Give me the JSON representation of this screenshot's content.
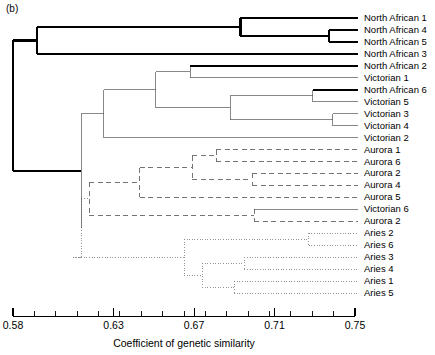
{
  "panel": {
    "label": "(b)"
  },
  "axis": {
    "title": "Coefficient of genetic similarity",
    "min": 0.58,
    "max": 0.75,
    "major_ticks": [
      0.58,
      0.63,
      0.67,
      0.71,
      0.75
    ],
    "major_tick_labels": [
      "0.58",
      "0.63",
      "0.67",
      "0.71",
      "0.75"
    ],
    "minor_tick_count": 16
  },
  "colors": {
    "line": "#000000",
    "line_thin": "#555555",
    "line_dashed": "#666666",
    "line_dotted": "#888888",
    "axis": "#000000",
    "text": "#000000",
    "background": "#ffffff"
  },
  "chart_data": {
    "type": "dendrogram",
    "title": "",
    "xlabel": "Coefficient of genetic similarity",
    "ylabel": "",
    "xlim": [
      0.58,
      0.75
    ],
    "grid": false,
    "legend": "none",
    "leaf_order": [
      "North African 1",
      "North African 4",
      "North African 5",
      "North African 3",
      "North African 2",
      "Victorian 1",
      "North African 6",
      "Victorian 5",
      "Victorian 3",
      "Victorian 4",
      "Victorian 2",
      "Aurora 1",
      "Aurora 6",
      "Aurora 2",
      "Aurora 4",
      "Aurora 5",
      "Victorian 6",
      "Aurora 2",
      "Aries 2",
      "Aries 6",
      "Aries 3",
      "Aries 4",
      "Aries 1",
      "Aries 5"
    ],
    "leaves": [
      {
        "label": "North African 1",
        "style": "bold",
        "merge_at": 0.693
      },
      {
        "label": "North African 4",
        "style": "bold",
        "merge_at": 0.737
      },
      {
        "label": "North African 5",
        "style": "bold",
        "merge_at": 0.737
      },
      {
        "label": "North African 3",
        "style": "bold",
        "merge_at": 0.592
      },
      {
        "label": "North African 2",
        "style": "bold",
        "merge_at": 0.668
      },
      {
        "label": "Victorian 1",
        "style": "thin",
        "merge_at": 0.668
      },
      {
        "label": "North African 6",
        "style": "bold",
        "merge_at": 0.729
      },
      {
        "label": "Victorian 5",
        "style": "thin",
        "merge_at": 0.729
      },
      {
        "label": "Victorian 3",
        "style": "thin",
        "merge_at": 0.739
      },
      {
        "label": "Victorian 4",
        "style": "thin",
        "merge_at": 0.739
      },
      {
        "label": "Victorian 2",
        "style": "thin",
        "merge_at": 0.625
      },
      {
        "label": "Aurora 1",
        "style": "dashed",
        "merge_at": 0.681
      },
      {
        "label": "Aurora 6",
        "style": "dashed",
        "merge_at": 0.681
      },
      {
        "label": "Aurora 2",
        "style": "dashed",
        "merge_at": 0.699
      },
      {
        "label": "Aurora 4",
        "style": "dashed",
        "merge_at": 0.699
      },
      {
        "label": "Aurora 5",
        "style": "dashed",
        "merge_at": 0.643
      },
      {
        "label": "Victorian 6",
        "style": "thin",
        "merge_at": 0.7
      },
      {
        "label": "Aurora 2",
        "style": "dashed",
        "merge_at": 0.7
      },
      {
        "label": "Aries 2",
        "style": "dotted",
        "merge_at": 0.727
      },
      {
        "label": "Aries 6",
        "style": "dotted",
        "merge_at": 0.727
      },
      {
        "label": "Aries 3",
        "style": "dotted",
        "merge_at": 0.695
      },
      {
        "label": "Aries 4",
        "style": "dotted",
        "merge_at": 0.695
      },
      {
        "label": "Aries 1",
        "style": "dotted",
        "merge_at": 0.69
      },
      {
        "label": "Aries 5",
        "style": "dotted",
        "merge_at": 0.69
      }
    ],
    "nodes": [
      {
        "name": "na4-na5",
        "height": 0.737,
        "style": "bold",
        "children": [
          "North African 4",
          "North African 5"
        ]
      },
      {
        "name": "na1-na45",
        "height": 0.693,
        "style": "bold",
        "children": [
          "North African 1",
          "na4-na5"
        ]
      },
      {
        "name": "na-top-na3",
        "height": 0.592,
        "style": "bold",
        "children": [
          "na1-na45",
          "North African 3"
        ]
      },
      {
        "name": "na2-vic1",
        "height": 0.668,
        "style": "thin",
        "children": [
          "North African 2",
          "Victorian 1"
        ]
      },
      {
        "name": "na6-vic5",
        "height": 0.729,
        "style": "thin",
        "children": [
          "North African 6",
          "Victorian 5"
        ]
      },
      {
        "name": "vic3-vic4",
        "height": 0.739,
        "style": "thin",
        "children": [
          "Victorian 3",
          "Victorian 4"
        ]
      },
      {
        "name": "na6vic5-vic34",
        "height": 0.688,
        "style": "thin",
        "children": [
          "na6-vic5",
          "vic3-vic4"
        ]
      },
      {
        "name": "vic-upper",
        "height": 0.651,
        "style": "thin",
        "children": [
          "na2-vic1",
          "na6vic5-vic34"
        ]
      },
      {
        "name": "vic-upper-vic2",
        "height": 0.625,
        "style": "thin",
        "children": [
          "vic-upper",
          "Victorian 2"
        ]
      },
      {
        "name": "aur1-aur6",
        "height": 0.681,
        "style": "dashed",
        "children": [
          "Aurora 1",
          "Aurora 6"
        ]
      },
      {
        "name": "aur2-aur4",
        "height": 0.699,
        "style": "dashed",
        "children": [
          "Aurora 2",
          "Aurora 4"
        ]
      },
      {
        "name": "aur16-aur24",
        "height": 0.669,
        "style": "dashed",
        "children": [
          "aur1-aur6",
          "aur2-aur4"
        ]
      },
      {
        "name": "aur-top-aur5",
        "height": 0.643,
        "style": "dashed",
        "children": [
          "aur16-aur24",
          "Aurora 5"
        ]
      },
      {
        "name": "vic6-aur2b",
        "height": 0.7,
        "style": "dashed",
        "children": [
          "Victorian 6",
          "Aurora 2"
        ]
      },
      {
        "name": "aurora-cluster",
        "height": 0.618,
        "style": "dashed",
        "children": [
          "aur-top-aur5",
          "vic6-aur2b"
        ]
      },
      {
        "name": "aries2-aries6",
        "height": 0.727,
        "style": "dotted",
        "children": [
          "Aries 2",
          "Aries 6"
        ]
      },
      {
        "name": "aries3-aries4",
        "height": 0.695,
        "style": "dotted",
        "children": [
          "Aries 3",
          "Aries 4"
        ]
      },
      {
        "name": "aries1-aries5",
        "height": 0.69,
        "style": "dotted",
        "children": [
          "Aries 1",
          "Aries 5"
        ]
      },
      {
        "name": "aries34-aries15",
        "height": 0.674,
        "style": "dotted",
        "children": [
          "aries3-aries4",
          "aries1-aries5"
        ]
      },
      {
        "name": "aries26-aries3415",
        "height": 0.665,
        "style": "dotted",
        "children": [
          "aries2-aries6",
          "aries34-aries15"
        ]
      },
      {
        "name": "aries-cluster",
        "height": 0.61,
        "style": "dotted",
        "children": [
          "aries26-aries3415"
        ]
      },
      {
        "name": "aurora-aries",
        "height": 0.614,
        "style": "dotted",
        "children": [
          "aurora-cluster",
          "aries-cluster"
        ]
      },
      {
        "name": "vic-aurora-aries",
        "height": 0.614,
        "style": "thin",
        "children": [
          "vic-upper-vic2",
          "aurora-aries"
        ]
      },
      {
        "name": "root",
        "height": 0.58,
        "style": "bold",
        "children": [
          "na-top-na3",
          "vic-aurora-aries"
        ]
      }
    ]
  }
}
